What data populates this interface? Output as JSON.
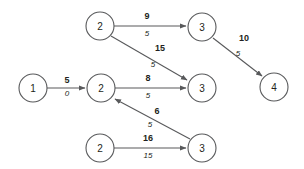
{
  "figure": {
    "type": "network-flow-diagram",
    "background_color": "#ffffff",
    "node_stroke_color": "#58595b",
    "edge_color": "#58595b",
    "text_color": "#231f20"
  },
  "nodes": [
    {
      "id": "n1",
      "label": "1",
      "cx": 33,
      "cy": 88,
      "r": 14
    },
    {
      "id": "n2a",
      "label": "2",
      "cx": 100,
      "cy": 26,
      "r": 14
    },
    {
      "id": "n2b",
      "label": "2",
      "cx": 101,
      "cy": 88,
      "r": 14
    },
    {
      "id": "n2c",
      "label": "2",
      "cx": 100,
      "cy": 148,
      "r": 14
    },
    {
      "id": "n3a",
      "label": "3",
      "cx": 202,
      "cy": 27,
      "r": 14
    },
    {
      "id": "n3b",
      "label": "3",
      "cx": 202,
      "cy": 88,
      "r": 14
    },
    {
      "id": "n3c",
      "label": "3",
      "cx": 202,
      "cy": 148,
      "r": 14
    },
    {
      "id": "n4",
      "label": "4",
      "cx": 274,
      "cy": 87,
      "r": 14
    }
  ],
  "edges": [
    {
      "id": "e-2a-3a",
      "from": "n2a",
      "to": "n3a",
      "capacity": "9",
      "flow": "5",
      "x1": 114,
      "y1": 26,
      "x2": 188,
      "y2": 26,
      "cap_x": 147,
      "cap_y": 19,
      "flow_x": 147,
      "flow_y": 35
    },
    {
      "id": "e-2a-3b",
      "from": "n2a",
      "to": "n3b",
      "capacity": "15",
      "flow": "5",
      "x1": 111,
      "y1": 36,
      "x2": 189,
      "y2": 81,
      "cap_x": 160,
      "cap_y": 50,
      "flow_x": 153,
      "flow_y": 66
    },
    {
      "id": "e-1-2b",
      "from": "n1",
      "to": "n2b",
      "capacity": "5",
      "flow": "0",
      "x1": 47,
      "y1": 88,
      "x2": 87,
      "y2": 88,
      "cap_x": 67,
      "cap_y": 82,
      "flow_x": 67,
      "flow_y": 95
    },
    {
      "id": "e-2b-3b",
      "from": "n2b",
      "to": "n3b",
      "capacity": "8",
      "flow": "5",
      "x1": 115,
      "y1": 88,
      "x2": 188,
      "y2": 88,
      "cap_x": 148,
      "cap_y": 81,
      "flow_x": 148,
      "flow_y": 97
    },
    {
      "id": "e-3c-2b",
      "from": "n3c",
      "to": "n2b",
      "capacity": "6",
      "flow": "5",
      "x1": 190,
      "y1": 139,
      "x2": 113,
      "y2": 98,
      "cap_x": 157,
      "cap_y": 113,
      "flow_x": 150,
      "flow_y": 126
    },
    {
      "id": "e-2c-3c",
      "from": "n2c",
      "to": "n3c",
      "capacity": "16",
      "flow": "15",
      "x1": 114,
      "y1": 148,
      "x2": 188,
      "y2": 148,
      "cap_x": 148,
      "cap_y": 141,
      "flow_x": 148,
      "flow_y": 157
    },
    {
      "id": "e-3a-4",
      "from": "n3a",
      "to": "n4",
      "capacity": "10",
      "flow": "5",
      "x1": 213,
      "y1": 37,
      "x2": 264,
      "y2": 77,
      "cap_x": 244,
      "cap_y": 40,
      "flow_x": 238,
      "flow_y": 55
    }
  ]
}
